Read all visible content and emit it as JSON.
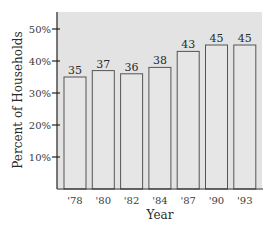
{
  "chart_data": {
    "type": "bar",
    "title": "",
    "xlabel": "Year",
    "ylabel": "Percent of Households",
    "categories": [
      "'78",
      "'80",
      "'82",
      "'84",
      "'87",
      "'90",
      "'93"
    ],
    "values": [
      35,
      37,
      36,
      38,
      43,
      45,
      45
    ],
    "yticks": [
      "10%",
      "20%",
      "30%",
      "40%",
      "50%"
    ],
    "ytick_values": [
      10,
      20,
      30,
      40,
      50
    ],
    "ylim": [
      0,
      55
    ],
    "grid": false,
    "legend": null,
    "colors": {
      "plot_background": "#e3e3e3",
      "bar_fill": "#e6e6e6",
      "bar_stroke": "#555555",
      "axis": "#222222"
    }
  }
}
